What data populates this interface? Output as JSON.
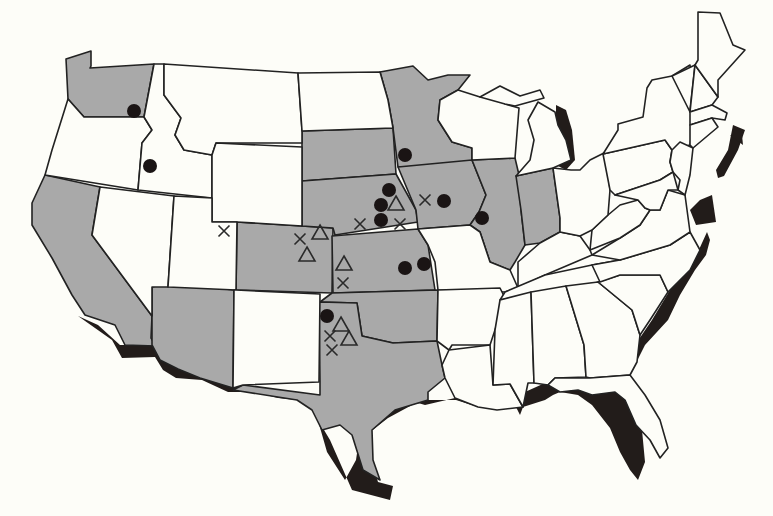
{
  "map": {
    "type": "choropleth-with-markers",
    "region": "Contiguous United States",
    "colors": {
      "background": "#fdfdf8",
      "shaded_state": "#a9a9a9",
      "unshaded_state": "#fdfdf8",
      "border": "#222222",
      "coast_shadow": "#221c1a",
      "marker": "#1a1414"
    },
    "shaded_states": [
      "WA",
      "CA",
      "AZ",
      "CO",
      "SD",
      "NE",
      "KS",
      "OK",
      "TX",
      "MN",
      "IA",
      "IL",
      "IN"
    ],
    "marker_types": [
      "filled-circle",
      "x-mark",
      "triangle"
    ],
    "markers": [
      {
        "type": "circle",
        "state": "WA",
        "x": 134,
        "y": 111
      },
      {
        "type": "circle",
        "state": "ID",
        "x": 150,
        "y": 166
      },
      {
        "type": "circle",
        "state": "MN",
        "x": 405,
        "y": 155
      },
      {
        "type": "circle",
        "state": "NE",
        "x": 389,
        "y": 190
      },
      {
        "type": "circle",
        "state": "NE",
        "x": 381,
        "y": 205
      },
      {
        "type": "circle",
        "state": "NE",
        "x": 381,
        "y": 220
      },
      {
        "type": "circle",
        "state": "IA",
        "x": 444,
        "y": 201
      },
      {
        "type": "circle",
        "state": "IL",
        "x": 482,
        "y": 218
      },
      {
        "type": "circle",
        "state": "KS",
        "x": 405,
        "y": 268
      },
      {
        "type": "circle",
        "state": "KS",
        "x": 424,
        "y": 264
      },
      {
        "type": "circle",
        "state": "OK",
        "x": 327,
        "y": 316
      },
      {
        "type": "x",
        "state": "UT",
        "x": 224,
        "y": 231
      },
      {
        "type": "x",
        "state": "CO",
        "x": 300,
        "y": 239
      },
      {
        "type": "x",
        "state": "NE",
        "x": 360,
        "y": 224
      },
      {
        "type": "x",
        "state": "NE",
        "x": 400,
        "y": 224
      },
      {
        "type": "x",
        "state": "IA",
        "x": 425,
        "y": 200
      },
      {
        "type": "x",
        "state": "KS",
        "x": 343,
        "y": 283
      },
      {
        "type": "x",
        "state": "OK",
        "x": 330,
        "y": 336
      },
      {
        "type": "x",
        "state": "OK",
        "x": 332,
        "y": 350
      },
      {
        "type": "triangle",
        "state": "CO",
        "x": 320,
        "y": 233
      },
      {
        "type": "triangle",
        "state": "CO",
        "x": 307,
        "y": 255
      },
      {
        "type": "triangle",
        "state": "NE",
        "x": 396,
        "y": 204
      },
      {
        "type": "triangle",
        "state": "KS",
        "x": 344,
        "y": 264
      },
      {
        "type": "triangle",
        "state": "OK",
        "x": 341,
        "y": 325
      },
      {
        "type": "triangle",
        "state": "OK",
        "x": 349,
        "y": 339
      }
    ]
  }
}
